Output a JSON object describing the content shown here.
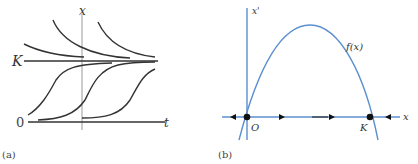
{
  "panel_a": {
    "caption": "(a)",
    "y_axis_label": "x",
    "x_axis_label": "t",
    "level_K_label": "K",
    "level_0_label": "0",
    "line_color": "#333333",
    "axis_color": "#888888"
  },
  "panel_b": {
    "caption": "(b)",
    "y_axis_label": "x'",
    "x_axis_label": "x",
    "curve_label": "f(x)",
    "origin_label": "O",
    "K_label": "K",
    "curve_color": "#5b8fd0",
    "point_color": "#111111"
  }
}
